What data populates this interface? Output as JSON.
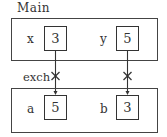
{
  "caller": {
    "title": "Main",
    "vars": [
      {
        "name": "x",
        "value": "3"
      },
      {
        "name": "y",
        "value": "5"
      }
    ]
  },
  "call": {
    "label": "exch",
    "marker_icon": "cross-mark"
  },
  "callee": {
    "vars": [
      {
        "name": "a",
        "value": "5"
      },
      {
        "name": "b",
        "value": "3"
      }
    ]
  }
}
